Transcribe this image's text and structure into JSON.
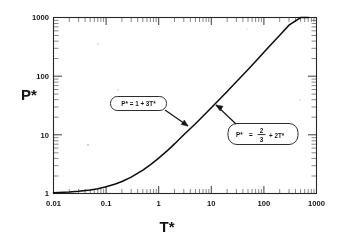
{
  "figure": {
    "background_color": "#ffffff",
    "ink_color": "#1a1a1a"
  },
  "chart_data": {
    "type": "line",
    "title": "",
    "subtitle": "",
    "xlabel": "T*",
    "ylabel": "P*",
    "xscale": "log",
    "yscale": "log",
    "xlim": [
      0.01,
      1000
    ],
    "ylim": [
      1,
      1000
    ],
    "grid": false,
    "legend_position": "none",
    "x_tick_labels": [
      "0.01",
      "0.1",
      "1",
      "10",
      "100",
      "1000"
    ],
    "x_tick_values": [
      0.01,
      0.1,
      1,
      10,
      100,
      1000
    ],
    "y_tick_labels": [
      "1",
      "10",
      "100",
      "1000"
    ],
    "y_tick_values": [
      1,
      10,
      100,
      1000
    ],
    "minor_ticks": true,
    "series": [
      {
        "name": "equation of state",
        "x": [
          0.01,
          0.02,
          0.03,
          0.05,
          0.07,
          0.1,
          0.15,
          0.2,
          0.3,
          0.5,
          0.7,
          1,
          1.5,
          2,
          3,
          5,
          7,
          10,
          15,
          20,
          30,
          50,
          70,
          100,
          150,
          200,
          300,
          500,
          700,
          1000
        ],
        "y": [
          1.03,
          1.06,
          1.09,
          1.15,
          1.21,
          1.3,
          1.45,
          1.6,
          1.9,
          2.5,
          3.1,
          4.0,
          5.5,
          7.0,
          10.0,
          15.5,
          21.0,
          29.0,
          42.0,
          55.0,
          80.0,
          130.0,
          180.0,
          255.0,
          380.0,
          500.0,
          740.0,
          1000.0,
          1400.0,
          2000.0
        ],
        "note": "low-T limit P* = 1 + 3T*, high-T limit P* = 2/3 + 2T*"
      }
    ],
    "annotations": [
      {
        "id": "low-temperature-limit",
        "text": "P* = 1 + 3T*",
        "lhs": "P*",
        "relation": "=",
        "rhs": "1 + 3T*",
        "has_fraction": false,
        "box_x": 0.33,
        "box_y": 33,
        "points_to_x": 3.2,
        "points_to_y": 13
      },
      {
        "id": "high-temperature-limit",
        "text": "P* = 2/3 + 2T*",
        "lhs": "P*",
        "relation": "=",
        "rhs_numerator": "2",
        "rhs_denominator": "3",
        "rhs_tail": "+ 2T*",
        "has_fraction": true,
        "box_x": 55,
        "box_y": 13,
        "points_to_x": 16,
        "points_to_y": 42
      }
    ]
  }
}
